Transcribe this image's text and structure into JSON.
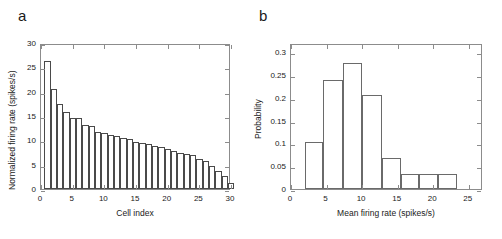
{
  "figure": {
    "panels": [
      {
        "label": "a",
        "axis": {
          "ylabel": "Normalized firing rate (spikes/s)",
          "xlabel": "Cell index",
          "yticks": [
            "0",
            "5",
            "10",
            "15",
            "20",
            "25",
            "30"
          ],
          "xticks": [
            "0",
            "5",
            "10",
            "15",
            "20",
            "25",
            "30"
          ]
        }
      },
      {
        "label": "b",
        "axis": {
          "ylabel": "Probability",
          "xlabel": "Mean firing rate (spikes/s)",
          "yticks": [
            "0",
            "0.05",
            "0.1",
            "0.15",
            "0.2",
            "0.25",
            "0.3"
          ],
          "xticks": [
            "0",
            "5",
            "10",
            "15",
            "20",
            "25"
          ]
        }
      }
    ]
  },
  "chart_data": [
    {
      "type": "bar",
      "panel": "a",
      "title": "",
      "xlabel": "Cell index",
      "ylabel": "Normalized firing rate (spikes/s)",
      "xlim": [
        0,
        30
      ],
      "ylim": [
        0,
        30
      ],
      "grid": false,
      "legend": null,
      "categories": [
        1,
        2,
        3,
        4,
        5,
        6,
        7,
        8,
        9,
        10,
        11,
        12,
        13,
        14,
        15,
        16,
        17,
        18,
        19,
        20,
        21,
        22,
        23,
        24,
        25,
        26,
        27,
        28,
        29
      ],
      "values": [
        26.3,
        20.6,
        17.4,
        15.8,
        14.6,
        14.5,
        13.1,
        12.9,
        11.7,
        11.6,
        11.0,
        10.8,
        10.5,
        10.2,
        9.7,
        9.5,
        9.2,
        8.9,
        8.6,
        8.3,
        7.9,
        7.5,
        7.2,
        6.9,
        6.2,
        5.8,
        4.8,
        3.6,
        2.6,
        1.3
      ],
      "ytick_values": [
        0,
        5,
        10,
        15,
        20,
        25,
        30
      ],
      "xtick_values": [
        0,
        5,
        10,
        15,
        20,
        25,
        30
      ]
    },
    {
      "type": "bar",
      "panel": "b",
      "title": "",
      "xlabel": "Mean firing rate (spikes/s)",
      "ylabel": "Probability",
      "xlim": [
        0,
        27
      ],
      "ylim": [
        0,
        0.32
      ],
      "grid": false,
      "legend": null,
      "bin_edges": [
        1.9,
        4.5,
        7.3,
        10.0,
        12.8,
        15.5,
        18.0,
        20.7,
        23.4,
        26.0
      ],
      "bin_centers": [
        3.2,
        5.9,
        8.6,
        11.4,
        14.1,
        19.3,
        22.0,
        24.7
      ],
      "values": [
        0.103,
        0.24,
        0.276,
        0.207,
        0.069,
        0.034,
        0.034,
        0.034
      ],
      "ytick_values": [
        0,
        0.05,
        0.1,
        0.15,
        0.2,
        0.25,
        0.3
      ],
      "xtick_values": [
        0,
        5,
        10,
        15,
        20,
        25
      ]
    }
  ]
}
